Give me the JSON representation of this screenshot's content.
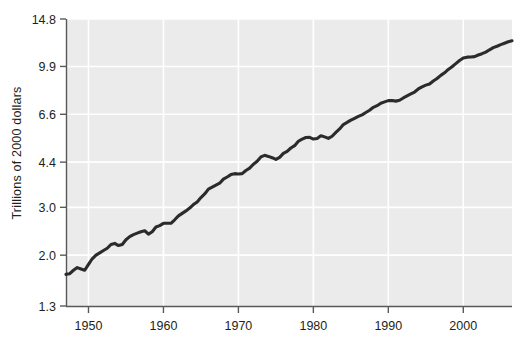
{
  "chart": {
    "ylabel": "Trillions of 2000 dollars",
    "xlabel": "",
    "title": ""
  },
  "colors": {
    "plot_background": "#ebebeb",
    "gridline": "#ffffff",
    "axis": "#58595b",
    "series_line": "#2b2b2b",
    "text": "#231f20",
    "page_background": "#ffffff"
  },
  "axes": {
    "y_ticks": [
      "1.3",
      "2.0",
      "3.0",
      "4.4",
      "6.6",
      "9.9",
      "14.8"
    ],
    "x_ticks": [
      "1950",
      "1960",
      "1970",
      "1980",
      "1990",
      "2000"
    ]
  },
  "chart_data": {
    "type": "line",
    "title": "",
    "xlabel": "",
    "ylabel": "Trillions of 2000 dollars",
    "yscale": "log",
    "ylim": [
      1.3,
      14.8
    ],
    "xlim": [
      1947.0,
      2006.5
    ],
    "grid": true,
    "legend": null,
    "ytick_values": [
      1.3,
      2.0,
      3.0,
      4.4,
      6.6,
      9.9,
      14.8
    ],
    "xtick_values": [
      1950,
      1960,
      1970,
      1980,
      1990,
      2000
    ],
    "series": [
      {
        "name": "Real GDP",
        "x": [
          1947.0,
          1947.5,
          1948.0,
          1948.5,
          1949.0,
          1949.5,
          1950.0,
          1950.5,
          1951.0,
          1951.5,
          1952.0,
          1952.5,
          1953.0,
          1953.5,
          1954.0,
          1954.5,
          1955.0,
          1955.5,
          1956.0,
          1956.5,
          1957.0,
          1957.5,
          1958.0,
          1958.5,
          1959.0,
          1959.5,
          1960.0,
          1960.5,
          1961.0,
          1961.5,
          1962.0,
          1962.5,
          1963.0,
          1963.5,
          1964.0,
          1964.5,
          1965.0,
          1965.5,
          1966.0,
          1966.5,
          1967.0,
          1967.5,
          1968.0,
          1968.5,
          1969.0,
          1969.5,
          1970.0,
          1970.5,
          1971.0,
          1971.5,
          1972.0,
          1972.5,
          1973.0,
          1973.5,
          1974.0,
          1974.5,
          1975.0,
          1975.5,
          1976.0,
          1976.5,
          1977.0,
          1977.5,
          1978.0,
          1978.5,
          1979.0,
          1979.5,
          1980.0,
          1980.5,
          1981.0,
          1981.5,
          1982.0,
          1982.5,
          1983.0,
          1983.5,
          1984.0,
          1984.5,
          1985.0,
          1985.5,
          1986.0,
          1986.5,
          1987.0,
          1987.5,
          1988.0,
          1988.5,
          1989.0,
          1989.5,
          1990.0,
          1990.5,
          1991.0,
          1991.5,
          1992.0,
          1992.5,
          1993.0,
          1993.5,
          1994.0,
          1994.5,
          1995.0,
          1995.5,
          1996.0,
          1996.5,
          1997.0,
          1997.5,
          1998.0,
          1998.5,
          1999.0,
          1999.5,
          2000.0,
          2000.5,
          2001.0,
          2001.5,
          2002.0,
          2002.5,
          2003.0,
          2003.5,
          2004.0,
          2004.5,
          2005.0,
          2005.5,
          2006.0,
          2006.5
        ],
        "y": [
          1.7,
          1.71,
          1.76,
          1.8,
          1.78,
          1.76,
          1.85,
          1.94,
          2.0,
          2.04,
          2.08,
          2.12,
          2.19,
          2.21,
          2.17,
          2.19,
          2.28,
          2.34,
          2.38,
          2.41,
          2.44,
          2.46,
          2.39,
          2.44,
          2.54,
          2.57,
          2.62,
          2.62,
          2.62,
          2.7,
          2.79,
          2.85,
          2.91,
          2.98,
          3.07,
          3.14,
          3.26,
          3.36,
          3.5,
          3.56,
          3.62,
          3.68,
          3.81,
          3.88,
          3.96,
          3.99,
          3.98,
          3.99,
          4.1,
          4.18,
          4.32,
          4.43,
          4.6,
          4.66,
          4.62,
          4.57,
          4.5,
          4.58,
          4.74,
          4.82,
          4.96,
          5.06,
          5.25,
          5.35,
          5.42,
          5.43,
          5.35,
          5.38,
          5.5,
          5.45,
          5.38,
          5.48,
          5.66,
          5.83,
          6.05,
          6.16,
          6.28,
          6.38,
          6.48,
          6.57,
          6.7,
          6.83,
          7.0,
          7.1,
          7.25,
          7.33,
          7.41,
          7.42,
          7.38,
          7.43,
          7.58,
          7.71,
          7.84,
          7.97,
          8.18,
          8.33,
          8.45,
          8.53,
          8.75,
          8.94,
          9.18,
          9.38,
          9.65,
          9.88,
          10.14,
          10.41,
          10.63,
          10.71,
          10.73,
          10.76,
          10.91,
          11.03,
          11.18,
          11.4,
          11.61,
          11.75,
          11.91,
          12.05,
          12.2,
          12.3
        ]
      }
    ]
  }
}
